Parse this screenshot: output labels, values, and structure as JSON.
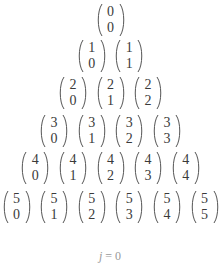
{
  "diagram": {
    "rows": [
      [
        {
          "n": "0",
          "k": "0"
        }
      ],
      [
        {
          "n": "1",
          "k": "0"
        },
        {
          "n": "1",
          "k": "1"
        }
      ],
      [
        {
          "n": "2",
          "k": "0"
        },
        {
          "n": "2",
          "k": "1"
        },
        {
          "n": "2",
          "k": "2"
        }
      ],
      [
        {
          "n": "3",
          "k": "0"
        },
        {
          "n": "3",
          "k": "1"
        },
        {
          "n": "3",
          "k": "2"
        },
        {
          "n": "3",
          "k": "3"
        }
      ],
      [
        {
          "n": "4",
          "k": "0"
        },
        {
          "n": "4",
          "k": "1"
        },
        {
          "n": "4",
          "k": "2"
        },
        {
          "n": "4",
          "k": "3"
        },
        {
          "n": "4",
          "k": "4"
        }
      ],
      [
        {
          "n": "5",
          "k": "0"
        },
        {
          "n": "5",
          "k": "1"
        },
        {
          "n": "5",
          "k": "2"
        },
        {
          "n": "5",
          "k": "3"
        },
        {
          "n": "5",
          "k": "4"
        },
        {
          "n": "5",
          "k": "5"
        }
      ]
    ],
    "caption": {
      "variable": "j",
      "operator": " = ",
      "value": "0"
    }
  },
  "colors": {
    "text": "#3a3a3a",
    "caption": "#9a9a9a",
    "background": "#ffffff"
  }
}
